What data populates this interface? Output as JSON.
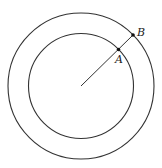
{
  "diagram": {
    "type": "concentric-circles",
    "points": [
      {
        "label": "A",
        "on": "inner circle"
      },
      {
        "label": "B",
        "on": "outer circle"
      }
    ],
    "colors": {
      "stroke": "#333333",
      "background": "#ffffff"
    }
  }
}
